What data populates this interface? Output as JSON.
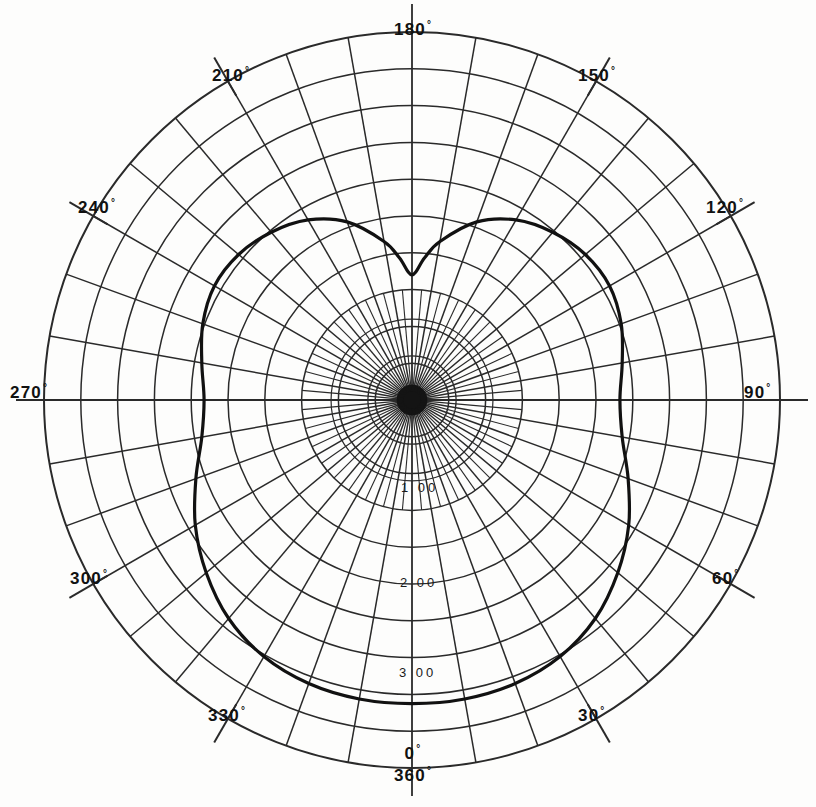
{
  "chart_data": {
    "type": "line",
    "title": "",
    "subtitle": "",
    "xlabel": "",
    "ylabel": "",
    "projection": "polar",
    "grid": true,
    "legend": null,
    "angular_axis": {
      "unit": "degrees",
      "range": [
        0,
        360
      ],
      "zero_location": "bottom",
      "direction": "counterclockwise_from_bottom_via_right",
      "major_tick_step": 30,
      "minor_tick_step": 10,
      "tick_labels": [
        "0°",
        "360°",
        "30°",
        "60°",
        "90°",
        "120°",
        "150°",
        "180°",
        "210°",
        "240°",
        "270°",
        "300°",
        "330°"
      ]
    },
    "radial_axis": {
      "range": [
        0,
        4.0
      ],
      "tick_labels": [
        "1.00",
        "2.00",
        "3.00"
      ],
      "tick_values": [
        1.0,
        2.0,
        3.0
      ],
      "label_angle_deg": 0,
      "ring_count": 10,
      "minor_rings": true
    },
    "series": [
      {
        "name": "pattern",
        "closed": true,
        "theta": [
          0,
          10,
          20,
          30,
          40,
          50,
          60,
          70,
          80,
          90,
          100,
          110,
          120,
          130,
          140,
          150,
          160,
          170,
          175,
          180,
          185,
          190,
          200,
          210,
          220,
          230,
          240,
          250,
          260,
          270,
          280,
          290,
          300,
          310,
          320,
          330,
          340,
          350
        ],
        "r": [
          3.3,
          3.3,
          3.28,
          3.22,
          3.1,
          2.92,
          2.72,
          2.5,
          2.32,
          2.26,
          2.32,
          2.42,
          2.48,
          2.46,
          2.38,
          2.26,
          2.06,
          1.75,
          1.55,
          1.36,
          1.55,
          1.75,
          2.06,
          2.26,
          2.38,
          2.46,
          2.48,
          2.42,
          2.32,
          2.26,
          2.32,
          2.5,
          2.72,
          2.92,
          3.1,
          3.22,
          3.28,
          3.3
        ]
      }
    ]
  },
  "labels": {
    "top": {
      "value": "180",
      "deg": "°"
    },
    "right": {
      "value": "90",
      "deg": "°"
    },
    "left": {
      "value": "270",
      "deg": "°"
    },
    "bottom_a": {
      "value": "0",
      "deg": "°"
    },
    "bottom_b": {
      "value": "360",
      "deg": "°"
    },
    "upper_left": {
      "value": "210",
      "deg": "°"
    },
    "upper_right": {
      "value": "150",
      "deg": "°"
    },
    "mid_upper_left": {
      "value": "240",
      "deg": "°"
    },
    "mid_upper_right": {
      "value": "120",
      "deg": "°"
    },
    "mid_lower_left": {
      "value": "300",
      "deg": "°"
    },
    "mid_lower_right": {
      "value": "60",
      "deg": "°"
    },
    "lower_left": {
      "value": "330",
      "deg": "°"
    },
    "lower_right": {
      "value": "30",
      "deg": "°"
    }
  },
  "radial_labels": {
    "r1": "1 00",
    "r2": "2 00",
    "r3": "3 00"
  },
  "colors": {
    "ink": "#111111",
    "grid": "#2a2a2a",
    "curve": "#111111",
    "paper": "#fdfdfc"
  }
}
